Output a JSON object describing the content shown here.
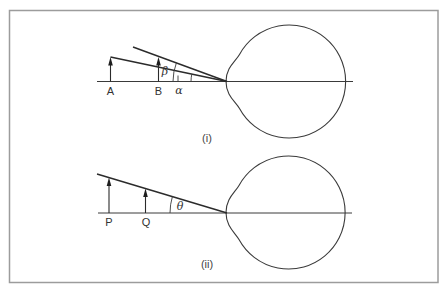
{
  "figure": {
    "panels": [
      {
        "id": "i",
        "label": "(i)",
        "objects": [
          "A",
          "B"
        ],
        "angles": {
          "alpha": "α",
          "beta": "β"
        }
      },
      {
        "id": "ii",
        "label": "(ii)",
        "objects": [
          "P",
          "Q"
        ],
        "angles": {
          "theta": "θ"
        }
      }
    ]
  },
  "colors": {
    "line": "#2b2b2b",
    "frame": "#9c9c9c",
    "background": "#ffffff"
  }
}
